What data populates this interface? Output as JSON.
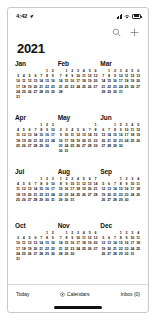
{
  "status_bar": {
    "time": "4:42",
    "location_icon": "location-arrow-icon",
    "signal_icon": "cellular-signal-icon",
    "wifi_icon": "wifi-icon",
    "battery_icon": "battery-icon"
  },
  "navbar": {
    "search_icon": "search-icon",
    "add_icon": "plus-icon"
  },
  "header": {
    "year": "2021"
  },
  "toolbar": {
    "today_label": "Today",
    "calendars_label": "Calendars",
    "calendars_icon": "calendars-circle-icon",
    "inbox_label": "Inbox (0)"
  },
  "colors": {
    "text": "#111111",
    "separator": "#d6d6d6",
    "frame_border": "#c9c9c9",
    "background": "#ffffff",
    "home_indicator": "#111111"
  },
  "calendar": {
    "year": 2021,
    "months": [
      {
        "name": "Jan",
        "start_weekday": 5,
        "days": 31
      },
      {
        "name": "Feb",
        "start_weekday": 1,
        "days": 28
      },
      {
        "name": "Mar",
        "start_weekday": 1,
        "days": 31
      },
      {
        "name": "Apr",
        "start_weekday": 4,
        "days": 30
      },
      {
        "name": "May",
        "start_weekday": 6,
        "days": 31
      },
      {
        "name": "Jun",
        "start_weekday": 2,
        "days": 30
      },
      {
        "name": "Jul",
        "start_weekday": 4,
        "days": 31
      },
      {
        "name": "Aug",
        "start_weekday": 0,
        "days": 31
      },
      {
        "name": "Sep",
        "start_weekday": 3,
        "days": 30
      },
      {
        "name": "Oct",
        "start_weekday": 5,
        "days": 31
      },
      {
        "name": "Nov",
        "start_weekday": 1,
        "days": 30
      },
      {
        "name": "Dec",
        "start_weekday": 3,
        "days": 31
      }
    ]
  }
}
